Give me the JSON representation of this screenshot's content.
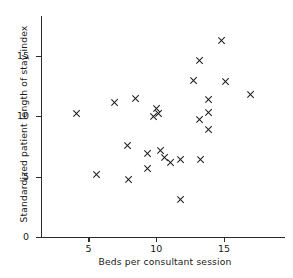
{
  "chart_data": {
    "type": "scatter",
    "title": "",
    "xlabel": "Beds per consultant session",
    "ylabel": "Standardized patient length of stay index",
    "xlim": [
      1.5,
      19.5
    ],
    "ylim": [
      0,
      18.3
    ],
    "xticks": [
      5,
      10,
      15
    ],
    "yticks": [
      0,
      5,
      10,
      15
    ],
    "xticklabels": [
      "5",
      "10",
      "15"
    ],
    "yticklabels": [
      "0",
      "5",
      "10",
      "15"
    ],
    "grid": false,
    "legend": null,
    "marker": "x",
    "marker_color": "#1a1a1a",
    "points": [
      {
        "x": 4.1,
        "y": 10.2
      },
      {
        "x": 5.6,
        "y": 5.2
      },
      {
        "x": 6.9,
        "y": 11.1
      },
      {
        "x": 7.9,
        "y": 7.6
      },
      {
        "x": 8.0,
        "y": 4.8
      },
      {
        "x": 8.5,
        "y": 11.5
      },
      {
        "x": 9.4,
        "y": 6.9
      },
      {
        "x": 9.4,
        "y": 5.7
      },
      {
        "x": 9.8,
        "y": 10.0
      },
      {
        "x": 10.0,
        "y": 10.6
      },
      {
        "x": 10.2,
        "y": 10.2
      },
      {
        "x": 10.3,
        "y": 7.2
      },
      {
        "x": 10.6,
        "y": 6.6
      },
      {
        "x": 11.1,
        "y": 6.2
      },
      {
        "x": 11.8,
        "y": 6.4
      },
      {
        "x": 11.8,
        "y": 3.1
      },
      {
        "x": 12.8,
        "y": 13.0
      },
      {
        "x": 13.2,
        "y": 14.6
      },
      {
        "x": 13.2,
        "y": 9.7
      },
      {
        "x": 13.3,
        "y": 6.4
      },
      {
        "x": 13.9,
        "y": 11.4
      },
      {
        "x": 13.9,
        "y": 10.3
      },
      {
        "x": 13.9,
        "y": 8.9
      },
      {
        "x": 14.8,
        "y": 16.3
      },
      {
        "x": 15.1,
        "y": 12.9
      },
      {
        "x": 17.0,
        "y": 11.8
      }
    ]
  }
}
